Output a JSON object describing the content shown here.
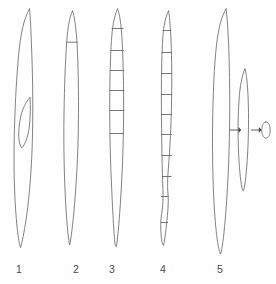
{
  "plate": {
    "background_color": "#fefefe",
    "line_color": "#6b6b6b",
    "label_color": "#4a4a4a",
    "width": 276,
    "height": 284,
    "caption": ""
  },
  "figures": [
    {
      "id": "figure-1",
      "label": "1",
      "label_x": 19,
      "label_y": 273,
      "description": "elongated fusiform spore, aseptate, with inner lens-shaped body at mid-length",
      "axis_x": 24,
      "top_y": 8,
      "bottom_y": 248,
      "max_width": 24,
      "septa_count": 0,
      "septa_y": [],
      "inner_body": {
        "name": "inner-lens-body",
        "top_y": 96,
        "bottom_y": 148,
        "left_x": 18,
        "right_x": 30
      },
      "outline_path": "M 29.5 9 C 24 18 20.5 34 18.5 56 C 16.2 82 14.8 110 14.2 140 C 13.6 172 14.6 204 17.2 228 C 18.4 239 19.6 245.5 20.6 247.5 C 21.5 245 23.2 237 25.4 224 C 28.6 204 31.2 176 32.2 146 C 33.2 114 32.8 80 31.8 54 C 31.0 32 30.4 16 29.5 9 Z",
      "inner_path": "M 30.0 97.5 C 24.5 103 20.6 113 19.2 126 C 18.0 136.5 19.0 144 21.6 147.8 C 25.0 145 27.6 138 29.2 128 C 30.4 118 30.6 106 30.0 97.5 Z"
    },
    {
      "id": "figure-2",
      "label": "2",
      "label_x": 76,
      "label_y": 273,
      "description": "elongated fusiform spore with a single basal septum near the apex",
      "axis_x": 73,
      "top_y": 10,
      "bottom_y": 246,
      "max_width": 19,
      "septa_count": 1,
      "septa_y": [
        42
      ],
      "inner_body": null,
      "outline_path": "M 72.5 11 C 69.6 17 67.8 27 66.8 41 C 65.4 60 64.4 86 64.0 114 C 63.5 146 64.2 182 66.2 212 C 67.4 230 68.6 240 69.6 245 C 70.6 241 72.0 231 73.6 215 C 76.2 188 78.0 156 78.4 124 C 78.8 94 78.2 64 77.0 43 C 76.0 27 74.4 16 72.5 11 Z",
      "septa_paths": [
        "M 66.7 42.2 L 77.2 42.2"
      ]
    },
    {
      "id": "figure-3",
      "label": "3",
      "label_x": 112,
      "label_y": 273,
      "description": "elongated spore with six transverse septa in the upper two thirds",
      "axis_x": 118,
      "top_y": 8,
      "bottom_y": 248,
      "max_width": 17,
      "septa_count": 6,
      "septa_y": [
        28,
        50,
        70,
        90,
        110,
        133
      ],
      "inner_body": null,
      "outline_path": "M 117.5 9 C 114.6 15 112.8 24 111.8 36 C 110.6 50 110.0 70 109.8 92 C 109.5 120 110.0 152 111.4 182 C 112.6 210 113.8 233 115.0 244 C 115.8 247 116.2 247.5 116.6 246 C 117.4 240 118.8 226 120.2 206 C 122.2 178 123.4 146 123.6 116 C 123.8 88 123.2 62 122.2 42 C 121.2 24 119.6 13 117.5 9 Z",
      "septa_paths": [
        "M 112.0 28.5 L 123.0 28.5",
        "M 110.8 50.5 L 123.6 50.5",
        "M 110.2 70.5 L 123.8 70.5",
        "M 109.9 90.5 L 123.9 90.5",
        "M 109.8 110.5 L 123.8 110.5",
        "M 110.2 133.5 L 123.5 133.5"
      ]
    },
    {
      "id": "figure-4",
      "label": "4",
      "label_x": 163,
      "label_y": 273,
      "description": "elongated spore with ten transverse septa distributed along nearly its entire length",
      "axis_x": 169,
      "top_y": 10,
      "bottom_y": 246,
      "max_width": 19,
      "septa_count": 10,
      "septa_y": [
        30,
        52,
        73,
        94,
        114,
        134,
        155,
        176,
        196,
        222
      ],
      "inner_body": null,
      "outline_path": "M 168.5 11 C 165.4 17 163.6 26 162.8 38 C 161.8 52 161.4 72 161.4 96 C 161.4 124 161.8 156 162.8 186 C 163.2 198 163.0 206 161.6 214 C 160.6 220 160.4 228 161.2 236 C 161.8 242 162.6 245 163.4 245.5 C 164.2 243 165.6 234 167.0 220 C 168.2 208 168.6 200 168.0 194 C 167.4 188 167.4 180 168.4 168 C 170.0 148 171.2 124 171.6 100 C 172.0 74 171.6 50 170.8 36 C 170.0 24 169.6 15 168.5 11 Z",
      "septa_paths": [
        "M 163.0 30.5 L 171.0 30.5",
        "M 162.0 52.5 L 171.4 52.5",
        "M 161.6 73.5 L 171.6 73.5",
        "M 161.4 94.5 L 171.8 94.5",
        "M 161.4 114.5 L 171.8 114.5",
        "M 161.5 134.5 L 171.7 134.5",
        "M 161.8 155.5 L 171.5 155.5",
        "M 162.4 176.5 L 171.0 176.5",
        "M 161.4 196.5 L 168.2 196.5",
        "M 161.2 222.5 L 167.6 222.5"
      ]
    },
    {
      "id": "figure-5",
      "label": "5",
      "label_x": 220,
      "label_y": 273,
      "description": "large elongate body beside a smaller elongate body and a minute ovoid, linked by two arrows",
      "axis_x": 223,
      "top_y": 8,
      "bottom_y": 255,
      "max_width": 18,
      "septa_count": 0,
      "septa_y": [],
      "inner_body": null,
      "outline_path": "M 226.0 9 C 221.6 16 218.4 28 216.4 46 C 214.2 66 213.0 94 212.6 124 C 212.2 158 213.0 192 215.0 218 C 216.6 238 218.6 251 220.6 254 C 222.0 250 223.6 238 225.2 220 C 227.6 192 229.2 158 229.6 124 C 230.0 92 229.4 60 228.4 40 C 227.6 24 226.8 13 226.0 9 Z",
      "companions": [
        {
          "name": "figure-5-medium-body",
          "center_x": 244,
          "top_y": 68,
          "bottom_y": 192,
          "max_width": 13,
          "path": "M 245.0 69 C 242.0 75 240.0 86 239.0 100 C 238.0 115 237.8 132 238.4 148 C 239.0 166 240.4 180 242.0 188 C 242.8 191 243.2 191.5 243.8 190 C 245.0 185 246.6 172 247.6 154 C 248.6 136 248.8 116 248.2 100 C 247.6 84 246.4 73 245.0 69 Z"
        },
        {
          "name": "figure-5-small-ovoid",
          "center_x": 266,
          "center_y": 130,
          "rx": 4.0,
          "ry": 8.0,
          "path": "M 266 122 C 268.6 122 270.2 125.6 270.2 130 C 270.2 134.6 268.6 138.2 266 138.2 C 263.4 138.2 261.8 134.6 261.8 130 C 261.8 125.6 263.4 122 266 122 Z"
        }
      ],
      "arrows": [
        {
          "name": "arrow-large-to-medium",
          "from_x": 230,
          "to_x": 240,
          "y": 130,
          "direction": "right"
        },
        {
          "name": "arrow-medium-to-small",
          "from_x": 251,
          "to_x": 260,
          "y": 130,
          "direction": "right"
        }
      ]
    }
  ]
}
